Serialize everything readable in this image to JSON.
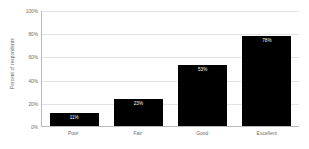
{
  "chart_data": {
    "type": "bar",
    "title": "",
    "xlabel": "",
    "ylabel": "Percent of respondents",
    "categories": [
      "Poor",
      "Fair",
      "Good",
      "Excellent"
    ],
    "values": [
      11,
      23,
      53,
      78
    ],
    "data_labels": [
      "11%",
      "23%",
      "53%",
      "78%"
    ],
    "ylim": [
      0,
      100
    ],
    "ytick_labels": [
      "0%",
      "20%",
      "40%",
      "60%",
      "80%",
      "100%"
    ],
    "ytick_values": [
      0,
      20,
      40,
      60,
      80,
      100
    ],
    "grid": true,
    "legend": false,
    "bar_color": "#000000",
    "data_label_color": "#ffffff",
    "gridline_color": "#e2e2e2",
    "axis_color": "#b9b9b9",
    "background_color": "#ffffff",
    "text_color": "#6e6e6e"
  }
}
